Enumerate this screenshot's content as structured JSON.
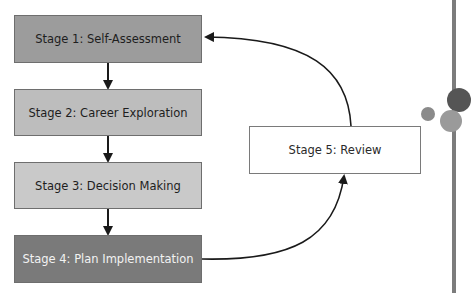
{
  "diagram": {
    "type": "flowchart",
    "stages": [
      {
        "id": "s1",
        "label": "Stage 1: Self-Assessment"
      },
      {
        "id": "s2",
        "label": "Stage 2: Career Exploration"
      },
      {
        "id": "s3",
        "label": "Stage 3: Decision Making"
      },
      {
        "id": "s4",
        "label": "Stage 4: Plan Implementation"
      },
      {
        "id": "s5",
        "label": "Stage 5: Review"
      }
    ],
    "edges": [
      {
        "from": "s1",
        "to": "s2"
      },
      {
        "from": "s2",
        "to": "s3"
      },
      {
        "from": "s3",
        "to": "s4"
      },
      {
        "from": "s4",
        "to": "s5"
      },
      {
        "from": "s5",
        "to": "s1"
      }
    ],
    "colors": {
      "stage1": "#9c9c9c",
      "stage2": "#bdbdbd",
      "stage3": "#c9c9c9",
      "stage4": "#7a7a7a",
      "stage5": "#ffffff",
      "arrow": "#1a1a1a"
    }
  }
}
